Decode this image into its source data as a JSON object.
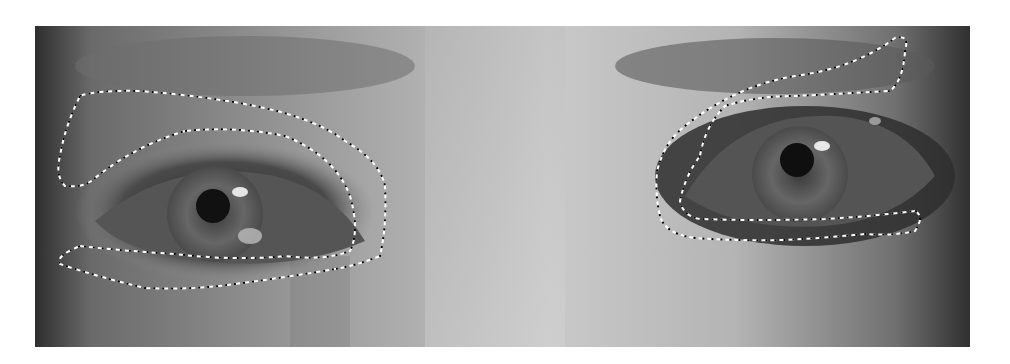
{
  "image": {
    "description": "Grayscale close-up photograph of a pair of eyes with dashed selection outlines around eye regions",
    "colors": {
      "background": "#ffffff",
      "skin_light": "#c8c8c8",
      "skin_mid": "#9a9a9a",
      "shadow": "#3a3a3a",
      "iris": "#5a5a5a",
      "pupil": "#111111",
      "outline_dash_a": "#ffffff",
      "outline_dash_b": "#000000"
    },
    "regions": [
      {
        "name": "left-eye-upper-outline"
      },
      {
        "name": "left-eye-inner-outline"
      },
      {
        "name": "left-eye-lower-outline"
      },
      {
        "name": "right-eye-upper-outline"
      },
      {
        "name": "right-eye-inner-outline"
      },
      {
        "name": "right-eye-lower-outline"
      }
    ]
  }
}
